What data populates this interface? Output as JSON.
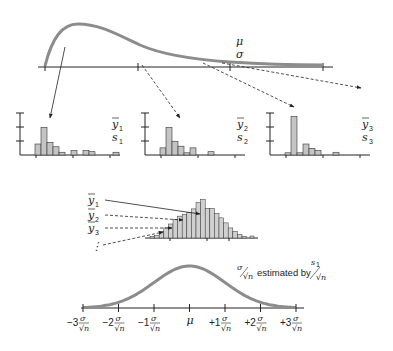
{
  "population": {
    "mean_label": "μ",
    "sd_label": "σ",
    "curve_color": "#8c8c8c"
  },
  "samples": [
    {
      "mean_label": "y",
      "mean_sub": "1",
      "sd_label": "s",
      "sd_sub": "1",
      "bars": [
        2,
        5,
        2.3,
        1.5,
        0.5,
        0,
        0.8,
        0,
        0.8,
        0.6,
        0,
        0,
        0,
        0.5
      ]
    },
    {
      "mean_label": "y",
      "mean_sub": "2",
      "sd_label": "s",
      "sd_sub": "2",
      "bars": [
        1.3,
        5,
        2.5,
        1.6,
        0.4,
        1.3,
        0,
        0,
        0.6
      ]
    },
    {
      "mean_label": "y",
      "mean_sub": "3",
      "sd_label": "s",
      "sd_sub": "3",
      "bars": [
        0.4,
        7,
        0.4,
        2,
        1.2,
        0.8,
        0,
        0,
        0.5
      ]
    }
  ],
  "sampling": {
    "labels": [
      {
        "text": "y",
        "sub": "1"
      },
      {
        "text": "y",
        "sub": "2"
      },
      {
        "text": "y",
        "sub": "3"
      }
    ],
    "ellipsis": "⋮",
    "bars": [
      0.3,
      0.5,
      1.2,
      1.8,
      2.5,
      3.3,
      3.9,
      4.2,
      4.6,
      5.2,
      6.3,
      6.9,
      5.3,
      5.3,
      4.4,
      3.6,
      2.7,
      1.8,
      1.2,
      0.6,
      0.3
    ]
  },
  "normal": {
    "annotation_text": "estimated by",
    "ticks": [
      "−3",
      "−2",
      "−1",
      "μ",
      "+1",
      "+2",
      "+3"
    ],
    "tick_unit": "σ/√n",
    "curve_color": "#8c8c8c"
  }
}
